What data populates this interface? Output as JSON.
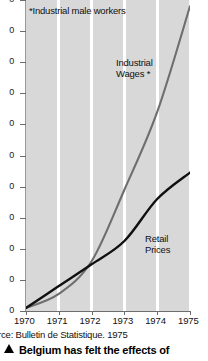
{
  "chart_data": {
    "type": "line",
    "title": "",
    "xlabel": "",
    "ylabel": "",
    "footnote": "*Industrial male workers",
    "source": "urce: Bulletin de Statistique. 1975",
    "grid": true,
    "legend_position": "inline-labels",
    "x": [
      1970,
      1971,
      1972,
      1973,
      1974,
      1975
    ],
    "xlim": [
      1970,
      1975
    ],
    "ylim": [
      0,
      200
    ],
    "y_ticks": [
      0,
      20,
      40,
      60,
      80,
      100,
      120,
      140,
      160,
      180,
      200
    ],
    "y_tick_labels": [
      "0",
      "0",
      "0",
      "0",
      "0",
      "0",
      "0",
      "0",
      "0",
      "0",
      "0"
    ],
    "x_tick_labels": [
      "1970",
      "1971",
      "1972",
      "1973",
      "1974",
      "1975"
    ],
    "series": [
      {
        "name": "Industrial Wages *",
        "color": "#6e6e6e",
        "label_text": "Industrial\nWages *",
        "values": [
          2,
          11,
          32,
          78,
          128,
          196
        ]
      },
      {
        "name": "Retail Prices",
        "color": "#101010",
        "label_text": "Retail\nPrices",
        "values": [
          2,
          16,
          30,
          45,
          72,
          89
        ]
      }
    ]
  },
  "chart": {
    "footnote": "*Industrial male workers",
    "wages_label_line1": "Industrial",
    "wages_label_line2": "Wages *",
    "retail_label_line1": "Retail",
    "retail_label_line2": "Prices",
    "source": "urce: Bulletin de Statistique. 1975",
    "x_labels": [
      "1970",
      "1971",
      "1972",
      "1973",
      "1974",
      "1975"
    ],
    "y_labels": [
      "0",
      "0",
      "0",
      "0",
      "0",
      "0",
      "0",
      "0",
      "0",
      "0",
      "0"
    ]
  },
  "caption": {
    "marker": "triangle-up",
    "text": "Belgium has felt the effects of"
  },
  "colors": {
    "plot_background": "#d8d8d8",
    "gridline": "#ffffff",
    "wages_line": "#6e6e6e",
    "retail_line": "#101010",
    "axis": "#6b6b6b",
    "text": "#111111"
  }
}
